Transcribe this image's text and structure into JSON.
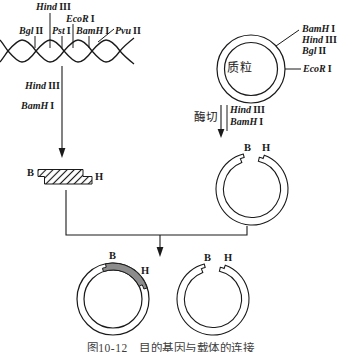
{
  "colors": {
    "line": "#1a1a1a",
    "insert_fill": "#8c8c8c"
  },
  "dna_map": {
    "sites": [
      {
        "name": "Hind",
        "num": "III"
      },
      {
        "name": "EcoR",
        "num": "I"
      },
      {
        "name": "Bgl",
        "num": "II"
      },
      {
        "name": "Pst",
        "num": "I"
      },
      {
        "name": "BamH",
        "num": "I"
      },
      {
        "name": "Pvu",
        "num": "II"
      }
    ]
  },
  "left_digest": {
    "enzymes": [
      {
        "name": "Hind",
        "num": "III"
      },
      {
        "name": "BamH",
        "num": "I"
      }
    ]
  },
  "fragment": {
    "left_end": "B",
    "right_end": "H"
  },
  "plasmid": {
    "label": "质粒",
    "upper_sites": [
      {
        "name": "BamH",
        "num": "I"
      },
      {
        "name": "Hind",
        "num": "III"
      },
      {
        "name": "Bgl",
        "num": "II"
      }
    ],
    "right_site": {
      "name": "EcoR",
      "num": "I"
    }
  },
  "right_digest": {
    "action": "酶切",
    "enzymes": [
      {
        "name": "Hind",
        "num": "III"
      },
      {
        "name": "BamH",
        "num": "I"
      }
    ]
  },
  "cut_plasmid": {
    "b_end": "B",
    "h_end": "H"
  },
  "recombinant_plasmid": {
    "b_end": "B",
    "h_end": "H"
  },
  "recircularized_vector": {
    "b_end": "B",
    "h_end": "H"
  },
  "caption": "图10-12　目的基因与载体的连接"
}
